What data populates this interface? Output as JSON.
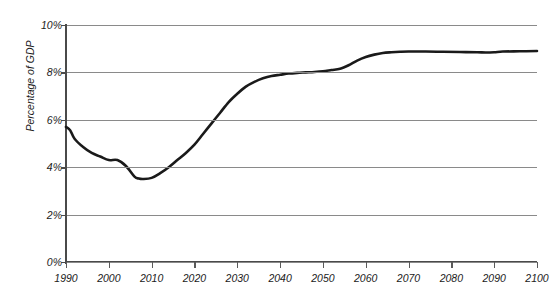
{
  "title_remnant": "",
  "chart_data": {
    "type": "line",
    "title": "",
    "xlabel": "",
    "ylabel": "Percentage of GDP",
    "xlim": [
      1990,
      2100
    ],
    "ylim": [
      0,
      10
    ],
    "grid": true,
    "legend": "none",
    "y_tick_labels": [
      "0%",
      "2%",
      "4%",
      "6%",
      "8%",
      "10%"
    ],
    "y_tick_values": [
      0,
      2,
      4,
      6,
      8,
      10
    ],
    "x_tick_labels": [
      "1990",
      "2000",
      "2010",
      "2020",
      "2030",
      "2040",
      "2050",
      "2060",
      "2070",
      "2080",
      "2090",
      "2100"
    ],
    "x_tick_values": [
      1990,
      2000,
      2010,
      2020,
      2030,
      2040,
      2050,
      2060,
      2070,
      2080,
      2090,
      2100
    ],
    "series": [
      {
        "name": "Percentage of GDP",
        "color": "#1a1a1a",
        "x": [
          1990,
          1991,
          1992,
          1994,
          1996,
          1998,
          2000,
          2002,
          2004,
          2006,
          2007,
          2008,
          2010,
          2012,
          2014,
          2016,
          2018,
          2020,
          2022,
          2024,
          2026,
          2028,
          2030,
          2032,
          2034,
          2036,
          2038,
          2040,
          2042,
          2044,
          2046,
          2048,
          2050,
          2052,
          2054,
          2056,
          2058,
          2060,
          2062,
          2064,
          2066,
          2068,
          2070,
          2074,
          2078,
          2082,
          2086,
          2088,
          2090,
          2092,
          2096,
          2100
        ],
        "values": [
          5.7,
          5.55,
          5.2,
          4.85,
          4.6,
          4.45,
          4.3,
          4.3,
          4.05,
          3.6,
          3.52,
          3.5,
          3.55,
          3.75,
          4.0,
          4.3,
          4.6,
          4.95,
          5.4,
          5.85,
          6.3,
          6.75,
          7.1,
          7.4,
          7.6,
          7.75,
          7.85,
          7.9,
          7.95,
          7.98,
          8.0,
          8.02,
          8.05,
          8.1,
          8.15,
          8.3,
          8.5,
          8.65,
          8.75,
          8.82,
          8.85,
          8.87,
          8.88,
          8.88,
          8.87,
          8.86,
          8.85,
          8.84,
          8.85,
          8.88,
          8.89,
          8.9
        ]
      }
    ]
  }
}
